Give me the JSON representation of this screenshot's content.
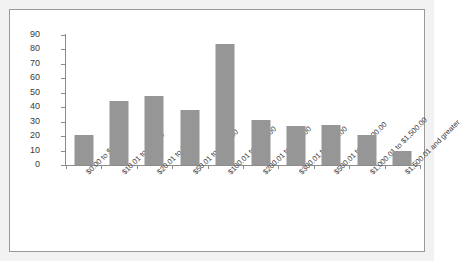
{
  "chart_data": {
    "type": "bar",
    "title": "",
    "subtitle": "",
    "xlabel": "",
    "ylabel": "",
    "categories": [
      "$0.00 to $10.00",
      "$10.01 to $20.00",
      "$20.01 to $50.00",
      "$50.01 to $100.00",
      "$100.01 to $200.00",
      "$200.01 to $300.00",
      "$300.01 to $500.00",
      "$500.01 to $1,000.00",
      "$1,000.01 to $1,500.00",
      "$1,500.01 and greater"
    ],
    "values": [
      21,
      44,
      48,
      38,
      84,
      31,
      27,
      28,
      21,
      10
    ],
    "ylim": [
      0,
      90
    ],
    "y_ticks": [
      90,
      80,
      70,
      60,
      50,
      40,
      30,
      20,
      10,
      0
    ],
    "grid": false,
    "legend": "none",
    "series_color": "#969696",
    "axis_color": "#8c8c8c",
    "border_color": "#9a9a9a",
    "plot_background": "#ffffff",
    "figure_background": "#f2f2f2"
  }
}
